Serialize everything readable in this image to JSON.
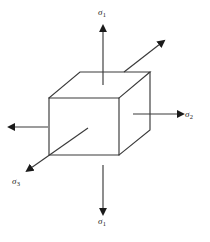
{
  "diagram": {
    "name": "principal-stress-cube",
    "background_color": "#ffffff",
    "stroke_color": "#3a3a3a",
    "arrow_color": "#1a1a1a",
    "text_color": "#1a1a1a"
  },
  "labels": {
    "sigma_top": {
      "symbol": "σ",
      "subscript": "1"
    },
    "sigma_bottom": {
      "symbol": "σ",
      "subscript": "1"
    },
    "sigma_right": {
      "symbol": "σ",
      "subscript": "2"
    },
    "sigma_lower_left": {
      "symbol": "σ",
      "subscript": "3"
    }
  },
  "geometry": {
    "cube": {
      "front_top_left": [
        49,
        98
      ],
      "front_top_right": [
        119,
        98
      ],
      "front_bottom_right": [
        119,
        155
      ],
      "front_bottom_left": [
        49,
        155
      ],
      "back_top_left": [
        80,
        72
      ],
      "back_top_right": [
        150,
        72
      ],
      "back_bottom_right": [
        150,
        130
      ]
    },
    "arrows": {
      "sigma1_up": {
        "from": [
          103,
          85
        ],
        "to": [
          103,
          28
        ]
      },
      "sigma1_down": {
        "from": [
          103,
          165
        ],
        "to": [
          103,
          212
        ]
      },
      "sigma2_right": {
        "from": [
          133,
          114
        ],
        "to": [
          181,
          114
        ]
      },
      "sigma2_left": {
        "from": [
          48,
          127
        ],
        "to": [
          11,
          127
        ]
      },
      "sigma3_out": {
        "from": [
          88,
          128
        ],
        "to": [
          27,
          171
        ]
      },
      "sigma3_in": {
        "from": [
          124,
          72
        ],
        "to": [
          163,
          41
        ]
      }
    }
  }
}
